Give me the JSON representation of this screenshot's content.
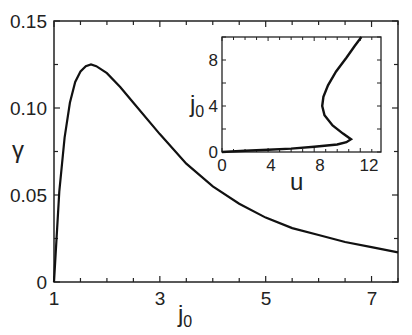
{
  "chart_data": [
    {
      "type": "line",
      "title": "",
      "xlabel": "j0",
      "ylabel": "γ",
      "xlim": [
        1,
        7.5
      ],
      "ylim": [
        0,
        0.15
      ],
      "xticks": [
        "1",
        "3",
        "5",
        "7"
      ],
      "yticks": [
        "0",
        "0.05",
        "0.10",
        "0.15"
      ],
      "grid": false,
      "legend": null,
      "series": [
        {
          "name": "gamma vs j0",
          "x": [
            1.0,
            1.1,
            1.2,
            1.3,
            1.4,
            1.5,
            1.6,
            1.7,
            1.8,
            2.0,
            2.25,
            2.5,
            3.0,
            3.5,
            4.0,
            4.5,
            5.0,
            5.5,
            6.0,
            6.5,
            7.0,
            7.5
          ],
          "y": [
            0.0,
            0.052,
            0.083,
            0.103,
            0.115,
            0.121,
            0.124,
            0.125,
            0.124,
            0.12,
            0.112,
            0.103,
            0.085,
            0.068,
            0.055,
            0.045,
            0.037,
            0.031,
            0.027,
            0.023,
            0.02,
            0.017
          ]
        }
      ]
    },
    {
      "type": "line",
      "title": "inset",
      "xlabel": "u",
      "ylabel": "j0",
      "xlim": [
        0,
        13
      ],
      "ylim": [
        0,
        10
      ],
      "xticks": [
        "0",
        "4",
        "8",
        "12"
      ],
      "yticks": [
        "0",
        "4",
        "8"
      ],
      "grid": false,
      "series": [
        {
          "name": "j0 vs u",
          "x": [
            0,
            2,
            4,
            6,
            8,
            10,
            10.8,
            11.2,
            10.5,
            9.6,
            8.9,
            8.7,
            8.8,
            9.2,
            9.9,
            10.8,
            11.5,
            12.1
          ],
          "y": [
            0,
            0.1,
            0.2,
            0.3,
            0.45,
            0.65,
            0.85,
            1.1,
            1.6,
            2.3,
            3.2,
            4.0,
            4.8,
            5.8,
            7.0,
            8.2,
            9.2,
            10.0
          ]
        }
      ]
    }
  ],
  "labels": {
    "y_main": "γ",
    "x_main_base": "j",
    "x_main_sub": "0",
    "x_inset": "u",
    "y_inset_base": "j",
    "y_inset_sub": "0"
  },
  "ticks": {
    "main_x": [
      "1",
      "3",
      "5",
      "7"
    ],
    "main_y": [
      "0",
      "0.05",
      "0.10",
      "0.15"
    ],
    "inset_x": [
      "0",
      "4",
      "8",
      "12"
    ],
    "inset_y": [
      "0",
      "4",
      "8"
    ]
  }
}
